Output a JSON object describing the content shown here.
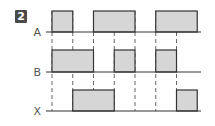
{
  "figure": {
    "badge": "2",
    "colors": {
      "pulse_fill": "#d6d6d6",
      "line": "#333333",
      "dashed": "#666666",
      "label": "#555555"
    }
  },
  "chart_data": {
    "type": "timing-diagram",
    "title": "",
    "time_units": [
      0,
      1,
      2,
      3,
      4,
      5,
      6,
      7
    ],
    "grid": "dashed vertical lines at t=0..6",
    "signals": [
      {
        "name": "A",
        "high_intervals": [
          [
            0,
            1
          ],
          [
            2,
            4
          ],
          [
            5,
            7
          ]
        ]
      },
      {
        "name": "B",
        "high_intervals": [
          [
            0,
            2
          ],
          [
            3,
            4
          ],
          [
            5,
            6
          ]
        ]
      },
      {
        "name": "X",
        "high_intervals": [
          [
            1,
            3
          ],
          [
            6,
            7
          ]
        ]
      }
    ]
  }
}
